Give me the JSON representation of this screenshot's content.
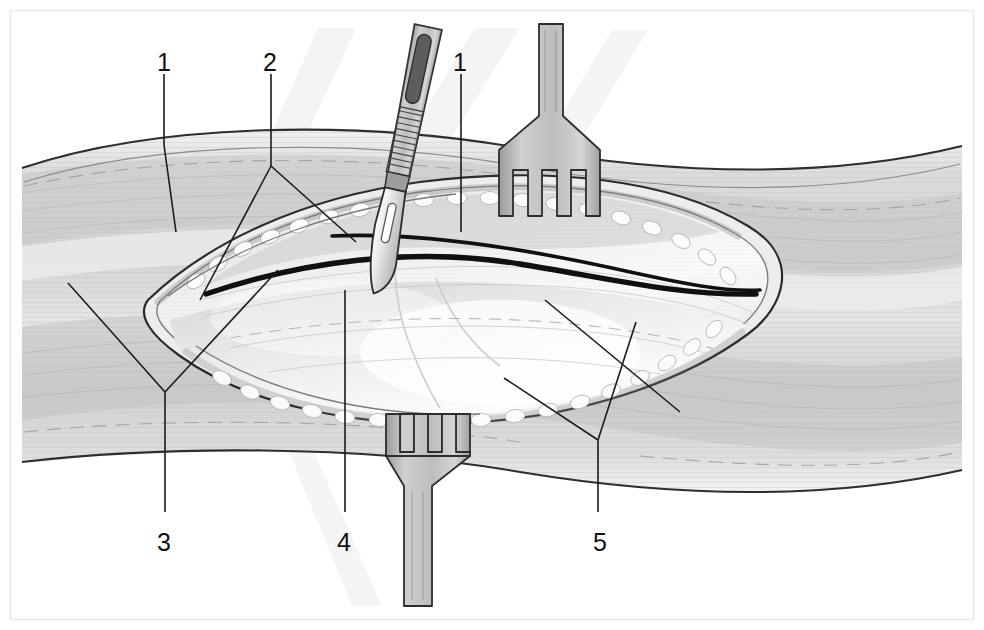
{
  "figure": {
    "domain": "medical-illustration",
    "style": "grayscale line and tone drawing",
    "canvas": {
      "width": 984,
      "height": 630
    },
    "background_color": "#ffffff",
    "border_color": "#e8e8e8"
  },
  "palette": {
    "ink": "#111111",
    "line_dark": "#1a1a1a",
    "line_mid": "#6f6f6f",
    "line_light": "#b9b9b9",
    "skin_base": "#d7d7d7",
    "skin_light": "#ececec",
    "skin_shadow": "#b3b3b3",
    "wound_fill": "#efefef",
    "fat_highlight": "#fbfbfb",
    "instrument_fill": "#bdbdbd",
    "instrument_dark": "#6b6b6b",
    "drop_shadow": "#f0f0f0"
  },
  "callouts": [
    {
      "id": "callout-1-left",
      "label": "1",
      "x": 157,
      "y": 50,
      "leader": "vertical line down to superficial skin layer, left side"
    },
    {
      "id": "callout-2",
      "label": "2",
      "x": 263,
      "y": 50,
      "leader": "vertical line down then forking to two points at wound upper edge"
    },
    {
      "id": "callout-1-right",
      "label": "1",
      "x": 453,
      "y": 50,
      "leader": "vertical line down into wound near scalpel blade"
    },
    {
      "id": "callout-3",
      "label": "3",
      "x": 157,
      "y": 530,
      "leader": "vertical line up then forking to two points at left wound apex"
    },
    {
      "id": "callout-4",
      "label": "4",
      "x": 337,
      "y": 530,
      "leader": "vertical line up into exposed deep tissue"
    },
    {
      "id": "callout-5",
      "label": "5",
      "x": 593,
      "y": 530,
      "leader": "vertical line up then forking to two points at lower right wound edge"
    }
  ],
  "instruments": [
    {
      "id": "scalpel",
      "name": "scalpel",
      "description": "angled scalpel with ribbed grip and blade entering incision from upper centre"
    },
    {
      "id": "retractor-top",
      "name": "three-prong-retractor",
      "description": "three-prong rake retractor pulling upper wound edge superiorly"
    },
    {
      "id": "retractor-bottom",
      "name": "three-prong-retractor",
      "description": "three-prong rake retractor pulling lower wound edge inferiorly"
    }
  ],
  "anatomy": [
    {
      "id": "skin-upper",
      "name": "skin and subcutaneous layer, proximal"
    },
    {
      "id": "skin-lower",
      "name": "skin and subcutaneous layer, distal"
    },
    {
      "id": "fat-edge",
      "name": "subcutaneous fat lining the incision margin"
    },
    {
      "id": "fascia",
      "name": "fascial plane exposed at base of wound"
    },
    {
      "id": "muscle",
      "name": "underlying muscle belly"
    }
  ]
}
